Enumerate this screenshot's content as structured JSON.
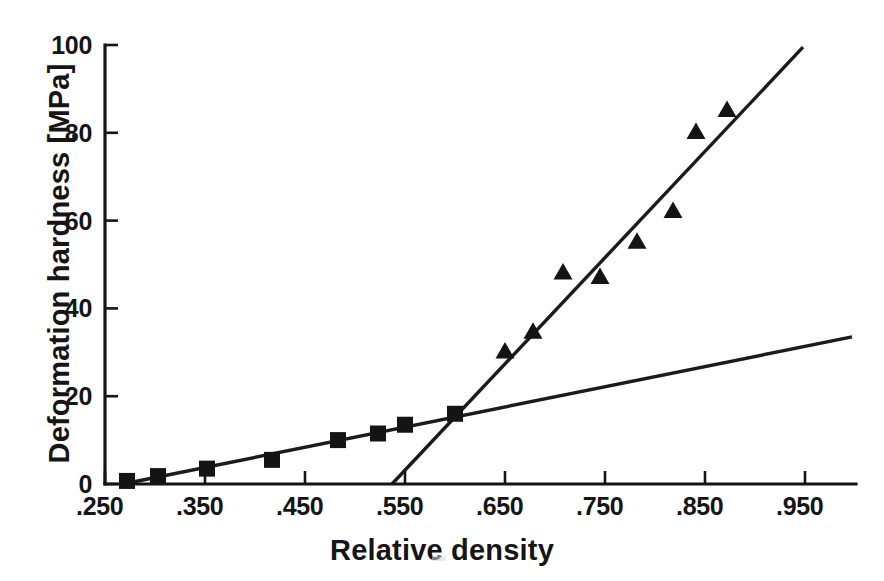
{
  "chart_data": {
    "type": "scatter",
    "title": "",
    "xlabel": "Relative density",
    "ylabel": "Deformation hardness [MPa]",
    "xlim": [
      0.25,
      0.95
    ],
    "ylim": [
      0,
      100
    ],
    "grid": false,
    "legend": "none",
    "x_tick_labels": [
      ".250",
      ".350",
      ".450",
      ".550",
      ".650",
      ".750",
      ".850",
      ".950"
    ],
    "x_tick_values": [
      0.25,
      0.35,
      0.45,
      0.55,
      0.65,
      0.75,
      0.85,
      0.95
    ],
    "y_tick_labels": [
      "0",
      "20",
      "40",
      "60",
      "80",
      "100"
    ],
    "y_tick_values": [
      0,
      20,
      40,
      60,
      80,
      100
    ],
    "series": [
      {
        "name": "Low-density stage (filled squares)",
        "marker": "square",
        "color": "#141414",
        "points": [
          {
            "x": 0.272,
            "y": 0.7
          },
          {
            "x": 0.303,
            "y": 1.8
          },
          {
            "x": 0.352,
            "y": 3.5
          },
          {
            "x": 0.417,
            "y": 5.5
          },
          {
            "x": 0.483,
            "y": 10.0
          },
          {
            "x": 0.523,
            "y": 11.5
          },
          {
            "x": 0.55,
            "y": 13.5
          },
          {
            "x": 0.6,
            "y": 16.0
          }
        ]
      },
      {
        "name": "High-density stage (filled triangles)",
        "marker": "triangle",
        "color": "#141414",
        "points": [
          {
            "x": 0.65,
            "y": 30.0
          },
          {
            "x": 0.678,
            "y": 34.5
          },
          {
            "x": 0.708,
            "y": 48.0
          },
          {
            "x": 0.745,
            "y": 47.0
          },
          {
            "x": 0.782,
            "y": 55.0
          },
          {
            "x": 0.818,
            "y": 62.0
          },
          {
            "x": 0.841,
            "y": 80.0
          },
          {
            "x": 0.872,
            "y": 85.0
          }
        ]
      }
    ],
    "fit_lines": [
      {
        "name": "Shallow fit line (low-density regime)",
        "x_start": 0.268,
        "y_start": 0.0,
        "x_end": 0.997,
        "y_end": 33.5
      },
      {
        "name": "Steep fit line (high-density regime)",
        "x_start": 0.537,
        "y_start": 0.0,
        "x_end": 0.948,
        "y_end": 99.5
      }
    ]
  }
}
